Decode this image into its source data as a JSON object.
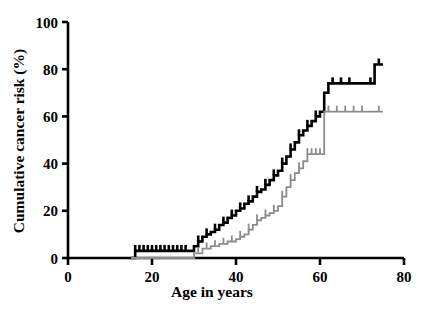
{
  "chart_data": {
    "type": "line",
    "title": "",
    "subtitle": "",
    "xlabel": "Age in years",
    "ylabel": "Cumulative cancer risk (%)",
    "xlim": [
      0,
      80
    ],
    "ylim": [
      0,
      100
    ],
    "xticks": [
      0,
      20,
      40,
      60,
      80
    ],
    "yticks": [
      0,
      20,
      40,
      60,
      80,
      100
    ],
    "xtick_labels": [
      "0",
      "20",
      "40",
      "60",
      "80"
    ],
    "ytick_labels": [
      "0",
      "20",
      "40",
      "60",
      "80",
      "100"
    ],
    "grid": false,
    "legend": "none",
    "style": "kaplan-meier step curves with censoring tick marks",
    "series": [
      {
        "name": "black-curve",
        "color": "#000000",
        "line_width": 2.6,
        "plot_style": "step-post",
        "x": [
          15,
          16,
          17,
          18,
          20,
          22,
          24,
          26,
          28,
          30,
          31,
          32,
          33,
          34,
          35,
          36,
          37,
          38,
          39,
          40,
          41,
          42,
          43,
          44,
          45,
          46,
          47,
          48,
          49,
          50,
          51,
          52,
          53,
          54,
          55,
          56,
          57,
          58,
          59,
          60,
          61,
          62,
          66,
          70,
          73,
          75
        ],
        "y": [
          0,
          3,
          3,
          3,
          3,
          3,
          3,
          3,
          3,
          5,
          7,
          9,
          10,
          11,
          12,
          14,
          15,
          17,
          18,
          20,
          21,
          23,
          24,
          26,
          28,
          29,
          31,
          33,
          35,
          37,
          40,
          43,
          46,
          49,
          52,
          54,
          56,
          58,
          60,
          62,
          70,
          74,
          74,
          74,
          82,
          82
        ],
        "censor_marks_x": [
          16,
          17,
          18,
          19,
          20,
          21,
          22,
          23,
          24,
          25,
          26,
          27,
          28,
          31,
          33,
          35,
          37,
          39,
          41,
          43,
          45,
          47,
          49,
          51,
          53,
          55,
          57,
          59,
          63,
          65,
          67,
          72,
          74
        ]
      },
      {
        "name": "gray-curve",
        "color": "#8c8c8c",
        "line_width": 1.8,
        "plot_style": "step-post",
        "x": [
          15,
          28,
          30,
          32,
          34,
          36,
          38,
          40,
          41,
          42,
          43,
          44,
          45,
          46,
          47,
          48,
          49,
          50,
          51,
          52,
          53,
          54,
          55,
          56,
          57,
          58,
          59,
          60,
          61,
          66,
          70,
          73,
          75
        ],
        "y": [
          0,
          0,
          2,
          4,
          5,
          6,
          7,
          8,
          9,
          10,
          12,
          14,
          16,
          17,
          18,
          19,
          20,
          22,
          26,
          30,
          33,
          36,
          38,
          41,
          44,
          44,
          44,
          44,
          62,
          62,
          62,
          62,
          62
        ],
        "censor_marks_x": [
          31,
          33,
          35,
          37,
          39,
          41,
          43,
          45,
          47,
          49,
          51,
          53,
          55,
          57,
          58,
          59,
          60,
          62,
          64,
          66,
          68,
          70,
          74
        ]
      }
    ],
    "endpoints": {
      "black_final_risk": 82,
      "gray_final_risk": 62,
      "black_start_age": 15,
      "gray_start_age": 15,
      "max_age_plotted": 75
    }
  },
  "axes": {
    "x_axis_name": "age-axis",
    "y_axis_name": "risk-axis"
  }
}
